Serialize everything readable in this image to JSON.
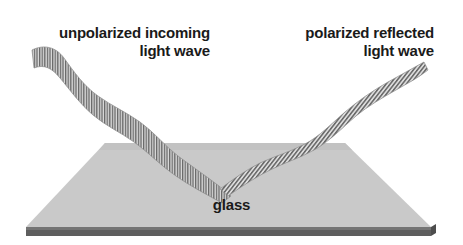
{
  "figure": {
    "background_color": "#ffffff",
    "width": 463,
    "height": 245
  },
  "labels": {
    "incoming": {
      "line1": "unpolarized incoming",
      "line2": "light wave",
      "color": "#1a1a1a"
    },
    "reflected": {
      "line1": "polarized reflected",
      "line2": "light wave",
      "color": "#1a1a1a"
    },
    "surface": {
      "text": "glass",
      "color": "#1a1a1a"
    }
  },
  "slab": {
    "name": "glass-slab",
    "top_face_color": "#c8c8c8",
    "edge_color": "#575757",
    "top_face_points": "105,143 345,143 431,228 26,228",
    "front_edge_points": "26,228 431,228 431,236 26,236",
    "front_edge_highlight": "#6b6b6b"
  },
  "waves": {
    "incoming": {
      "name": "unpolarized-incoming-wave",
      "hatch": "vertical",
      "hatch_color": "#6e6e6e",
      "fill_color": "#d4d4d4",
      "start": [
        32,
        52
      ],
      "end": [
        228,
        192
      ],
      "description": "wide hatched ribbon descending left to right onto the glass"
    },
    "reflected": {
      "name": "polarized-reflected-wave",
      "hatch": "diagonal",
      "hatch_color": "#6e6e6e",
      "fill_color": "#d4d4d4",
      "start": [
        228,
        192
      ],
      "end": [
        428,
        70
      ],
      "description": "narrow hatched ribbon rising right from the reflection point"
    },
    "reflection_point": [
      228,
      192
    ]
  },
  "icons": {
    "incoming_arrow": "wave-ribbon-icon",
    "reflected_arrow": "wave-ribbon-icon"
  }
}
